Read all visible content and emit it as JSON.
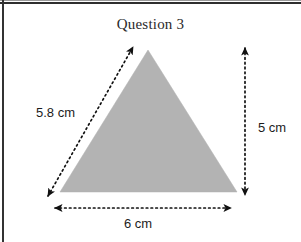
{
  "page": {
    "width": 301,
    "height": 242,
    "background": "#ffffff",
    "border_color": "#2e2e2e"
  },
  "title": "Question 3",
  "figure": {
    "shape_name": "triangle",
    "fill_color": "#b3b3b3",
    "stroke_color": "#b3b3b3",
    "vertices": {
      "apex": [
        148,
        50
      ],
      "bottom_left": [
        60,
        192
      ],
      "bottom_right": [
        237,
        192
      ]
    },
    "annotation_color": "#1c1c1c",
    "annotation_style": "dotted-double-arrow"
  },
  "dimensions": {
    "slant_side": {
      "label": "5.8 cm",
      "value": 5.8,
      "unit": "cm",
      "orientation": "diagonal-left",
      "arrow_from": [
        48,
        196
      ],
      "arrow_to": [
        133,
        47
      ]
    },
    "height": {
      "label": "5 cm",
      "value": 5,
      "unit": "cm",
      "orientation": "vertical-right",
      "arrow_from": [
        245,
        48
      ],
      "arrow_to": [
        245,
        195
      ]
    },
    "base": {
      "label": "6 cm",
      "value": 6,
      "unit": "cm",
      "orientation": "horizontal-bottom",
      "arrow_from": [
        55,
        208
      ],
      "arrow_to": [
        231,
        208
      ]
    }
  }
}
